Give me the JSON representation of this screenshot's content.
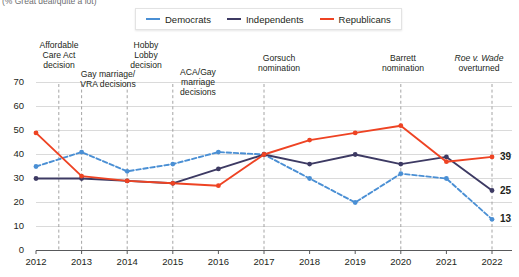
{
  "subtitle": "(% Great deal/quite a lot)",
  "legend": {
    "position": "top",
    "items": [
      {
        "label": "Democrats",
        "color": "#4a8fd4",
        "style": "dashed"
      },
      {
        "label": "Independents",
        "color": "#3d3a63",
        "style": "solid"
      },
      {
        "label": "Republicans",
        "color": "#ee4323",
        "style": "solid"
      }
    ]
  },
  "annotations": [
    {
      "id": "affordable-care-act",
      "text": "Affordable\nCare Act\ndecision",
      "year": 2012.5,
      "left": 28,
      "top": 41,
      "width": 62,
      "tick_top": 79,
      "tick_bottom": 104
    },
    {
      "id": "gay-marriage-vra",
      "text": "Gay marriage/\nVRA decisions",
      "year": 2013.0,
      "left": 70,
      "top": 70,
      "width": 76,
      "tick_top": 95,
      "tick_bottom": 104
    },
    {
      "id": "hobby-lobby",
      "text": "Hobby\nLobby\ndecision",
      "year": 2014.0,
      "left": 120,
      "top": 41,
      "width": 52,
      "tick_top": 79,
      "tick_bottom": 104
    },
    {
      "id": "aca-gay-marriage",
      "text": "ACA/Gay\nmarriage\ndecisions",
      "year": 2015.0,
      "left": 170,
      "top": 68,
      "width": 56,
      "tick_top": 101,
      "tick_bottom": 110
    },
    {
      "id": "gorsuch-nomination",
      "text": "Gorsuch\nnomination",
      "year": 2017.0,
      "left": 243,
      "top": 54,
      "width": 72,
      "tick_top": 78,
      "tick_bottom": 96
    },
    {
      "id": "barrett-nomination",
      "text": "Barrett\nnomination",
      "year": 2020.0,
      "left": 369,
      "top": 54,
      "width": 68,
      "tick_top": 78,
      "tick_bottom": 96
    },
    {
      "id": "roe-v-wade-overturned",
      "text": "Roe v. Wade\noverturned",
      "year": 2022.0,
      "left": 443,
      "top": 54,
      "width": 72,
      "tick_top": 78,
      "tick_bottom": 96,
      "italic_first_line": true
    }
  ],
  "chart_data": {
    "type": "line",
    "title": "",
    "subtitle": "(% Great deal/quite a lot)",
    "xlabel": "",
    "ylabel": "",
    "categories": [
      2012,
      2013,
      2014,
      2015,
      2016,
      2017,
      2018,
      2019,
      2020,
      2021,
      2022
    ],
    "xlim": [
      2012,
      2022
    ],
    "ylim": [
      0,
      70
    ],
    "yticks": [
      0,
      10,
      20,
      30,
      40,
      50,
      60,
      70
    ],
    "xticks": [
      "2012",
      "2013",
      "2014",
      "2015",
      "2016",
      "2017",
      "2018",
      "2019",
      "2020",
      "2021",
      "2022"
    ],
    "grid": true,
    "legend_position": "top",
    "series": [
      {
        "name": "Democrats",
        "color": "#4a8fd4",
        "style": "dashed",
        "values": [
          35,
          41,
          33,
          36,
          41,
          40,
          30,
          20,
          32,
          30,
          13
        ],
        "end_label": "13"
      },
      {
        "name": "Independents",
        "color": "#3d3a63",
        "style": "solid",
        "values": [
          30,
          30,
          29,
          28,
          34,
          40,
          36,
          40,
          36,
          39,
          25
        ],
        "end_label": "25"
      },
      {
        "name": "Republicans",
        "color": "#ee4323",
        "style": "solid",
        "values": [
          49,
          31,
          29,
          28,
          27,
          40,
          46,
          49,
          52,
          37,
          39
        ],
        "end_label": "39"
      }
    ]
  }
}
